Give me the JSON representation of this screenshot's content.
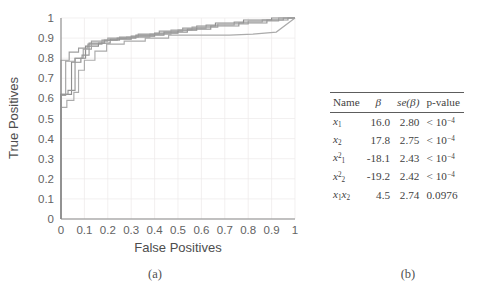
{
  "figure": {
    "panel_a_caption": "(a)",
    "panel_b_caption": "(b)"
  },
  "chart_data": {
    "type": "line",
    "title": "",
    "xlabel": "False Positives",
    "ylabel": "True Positives",
    "xlim": [
      0,
      1
    ],
    "ylim": [
      0,
      1
    ],
    "xticks": [
      "0",
      "0.1",
      "0.2",
      "0.3",
      "0.4",
      "0.5",
      "0.6",
      "0.7",
      "0.8",
      "0.9",
      "1"
    ],
    "yticks": [
      "0",
      "0.1",
      "0.2",
      "0.3",
      "0.4",
      "0.5",
      "0.6",
      "0.7",
      "0.8",
      "0.9",
      "1"
    ],
    "grid": true,
    "legend": "none",
    "series": [
      {
        "name": "roc-fold-1",
        "color": "#9e9e9e",
        "points": [
          [
            0,
            0
          ],
          [
            0,
            0.79
          ],
          [
            0.035,
            0.79
          ],
          [
            0.035,
            0.83
          ],
          [
            0.075,
            0.83
          ],
          [
            0.075,
            0.85
          ],
          [
            0.115,
            0.85
          ],
          [
            0.115,
            0.87
          ],
          [
            0.175,
            0.87
          ],
          [
            0.175,
            0.89
          ],
          [
            0.25,
            0.89
          ],
          [
            0.25,
            0.905
          ],
          [
            0.33,
            0.905
          ],
          [
            0.33,
            0.92
          ],
          [
            0.42,
            0.92
          ],
          [
            0.42,
            0.935
          ],
          [
            0.52,
            0.935
          ],
          [
            0.52,
            0.95
          ],
          [
            0.62,
            0.95
          ],
          [
            0.62,
            0.965
          ],
          [
            0.74,
            0.965
          ],
          [
            0.74,
            0.98
          ],
          [
            0.86,
            0.98
          ],
          [
            0.86,
            0.99
          ],
          [
            0.95,
            0.99
          ],
          [
            0.95,
            1
          ],
          [
            1,
            1
          ]
        ]
      },
      {
        "name": "roc-fold-2",
        "color": "#8f8f8f",
        "points": [
          [
            0,
            0
          ],
          [
            0,
            0.62
          ],
          [
            0.045,
            0.62
          ],
          [
            0.045,
            0.78
          ],
          [
            0.085,
            0.78
          ],
          [
            0.085,
            0.8
          ],
          [
            0.105,
            0.8
          ],
          [
            0.105,
            0.86
          ],
          [
            0.16,
            0.86
          ],
          [
            0.16,
            0.875
          ],
          [
            0.21,
            0.875
          ],
          [
            0.21,
            0.895
          ],
          [
            0.3,
            0.895
          ],
          [
            0.3,
            0.91
          ],
          [
            0.4,
            0.91
          ],
          [
            0.4,
            0.925
          ],
          [
            0.5,
            0.925
          ],
          [
            0.5,
            0.94
          ],
          [
            0.58,
            0.94
          ],
          [
            0.58,
            0.96
          ],
          [
            0.66,
            0.96
          ],
          [
            0.66,
            0.975
          ],
          [
            0.78,
            0.975
          ],
          [
            0.78,
            0.99
          ],
          [
            0.9,
            0.99
          ],
          [
            0.9,
            1
          ],
          [
            1,
            1
          ]
        ]
      },
      {
        "name": "roc-fold-3",
        "color": "#ababab",
        "points": [
          [
            0,
            0
          ],
          [
            0,
            0.555
          ],
          [
            0.025,
            0.555
          ],
          [
            0.025,
            0.59
          ],
          [
            0.055,
            0.59
          ],
          [
            0.055,
            0.63
          ],
          [
            0.075,
            0.63
          ],
          [
            0.075,
            0.74
          ],
          [
            0.1,
            0.74
          ],
          [
            0.1,
            0.79
          ],
          [
            0.145,
            0.79
          ],
          [
            0.145,
            0.835
          ],
          [
            0.195,
            0.835
          ],
          [
            0.195,
            0.87
          ],
          [
            0.27,
            0.87
          ],
          [
            0.27,
            0.885
          ],
          [
            0.36,
            0.885
          ],
          [
            0.36,
            0.9
          ],
          [
            0.46,
            0.9
          ],
          [
            0.46,
            0.915
          ],
          [
            0.58,
            0.915
          ],
          [
            0.58,
            0.915
          ],
          [
            0.72,
            0.915
          ],
          [
            0.82,
            0.92
          ],
          [
            0.92,
            0.93
          ],
          [
            1,
            1
          ]
        ]
      },
      {
        "name": "roc-fold-4",
        "color": "#a3a3a3",
        "points": [
          [
            0,
            0
          ],
          [
            0,
            0.615
          ],
          [
            0.02,
            0.615
          ],
          [
            0.02,
            0.785
          ],
          [
            0.06,
            0.785
          ],
          [
            0.06,
            0.8
          ],
          [
            0.095,
            0.8
          ],
          [
            0.095,
            0.845
          ],
          [
            0.13,
            0.845
          ],
          [
            0.13,
            0.885
          ],
          [
            0.2,
            0.885
          ],
          [
            0.2,
            0.9
          ],
          [
            0.28,
            0.9
          ],
          [
            0.28,
            0.905
          ],
          [
            0.38,
            0.905
          ],
          [
            0.38,
            0.92
          ],
          [
            0.47,
            0.92
          ],
          [
            0.47,
            0.94
          ],
          [
            0.56,
            0.94
          ],
          [
            0.56,
            0.955
          ],
          [
            0.67,
            0.955
          ],
          [
            0.67,
            0.97
          ],
          [
            0.8,
            0.97
          ],
          [
            0.8,
            0.985
          ],
          [
            0.93,
            0.985
          ],
          [
            0.93,
            1
          ],
          [
            1,
            1
          ]
        ]
      },
      {
        "name": "roc-fold-5",
        "color": "#979797",
        "points": [
          [
            0,
            0
          ],
          [
            0,
            0.62
          ],
          [
            0.03,
            0.62
          ],
          [
            0.03,
            0.64
          ],
          [
            0.06,
            0.64
          ],
          [
            0.06,
            0.8
          ],
          [
            0.09,
            0.8
          ],
          [
            0.09,
            0.815
          ],
          [
            0.12,
            0.815
          ],
          [
            0.12,
            0.875
          ],
          [
            0.185,
            0.875
          ],
          [
            0.185,
            0.89
          ],
          [
            0.24,
            0.89
          ],
          [
            0.24,
            0.9
          ],
          [
            0.32,
            0.9
          ],
          [
            0.32,
            0.915
          ],
          [
            0.44,
            0.915
          ],
          [
            0.44,
            0.93
          ],
          [
            0.54,
            0.93
          ],
          [
            0.54,
            0.945
          ],
          [
            0.64,
            0.945
          ],
          [
            0.64,
            0.96
          ],
          [
            0.76,
            0.96
          ],
          [
            0.76,
            0.975
          ],
          [
            0.88,
            0.975
          ],
          [
            0.88,
            0.99
          ],
          [
            0.97,
            0.99
          ],
          [
            0.97,
            1
          ],
          [
            1,
            1
          ]
        ]
      }
    ]
  },
  "table": {
    "columns": [
      "Name",
      "β",
      "se(β)",
      "p-value"
    ],
    "header_beta": "β",
    "header_se_prefix": "se(",
    "header_se_suffix": ")",
    "rows": [
      {
        "name_base": "x",
        "name_sub": "1",
        "name_sup": "",
        "name_extra_base": "",
        "name_extra_sub": "",
        "beta": "16.0",
        "se": "2.80",
        "p": "< 10",
        "p_exp": "−4"
      },
      {
        "name_base": "x",
        "name_sub": "2",
        "name_sup": "",
        "name_extra_base": "",
        "name_extra_sub": "",
        "beta": "17.8",
        "se": "2.75",
        "p": "< 10",
        "p_exp": "−4"
      },
      {
        "name_base": "x",
        "name_sub": "1",
        "name_sup": "2",
        "name_extra_base": "",
        "name_extra_sub": "",
        "beta": "-18.1",
        "se": "2.43",
        "p": "< 10",
        "p_exp": "−4"
      },
      {
        "name_base": "x",
        "name_sub": "2",
        "name_sup": "2",
        "name_extra_base": "",
        "name_extra_sub": "",
        "beta": "-19.2",
        "se": "2.42",
        "p": "< 10",
        "p_exp": "−4"
      },
      {
        "name_base": "x",
        "name_sub": "1",
        "name_sup": "",
        "name_extra_base": "x",
        "name_extra_sub": "2",
        "beta": "4.5",
        "se": "2.74",
        "p": "0.0976",
        "p_exp": ""
      }
    ]
  },
  "colors": {
    "axis": "#8a8a8a",
    "grid": "#eceaea",
    "text": "#595959",
    "table_rule": "#5d5d5d"
  }
}
